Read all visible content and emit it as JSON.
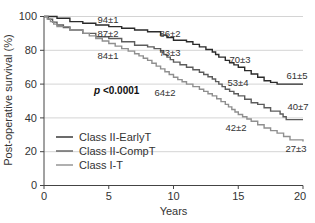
{
  "chart_data": {
    "type": "line",
    "subtype": "kaplan-meier step",
    "title": "",
    "xlabel": "Years",
    "ylabel": "Post-operative survival (%)",
    "xlim": [
      0,
      20
    ],
    "ylim": [
      0,
      100
    ],
    "xticks": [
      0,
      5,
      10,
      15,
      20
    ],
    "yticks": [
      0,
      20,
      40,
      60,
      80,
      100
    ],
    "grid": "horizontal",
    "legend_position": "lower-left",
    "annotation_text": "p <0.0001",
    "series": [
      {
        "name": "Class II-EarlyT",
        "color": "#2b2b2b",
        "x": [
          0,
          1,
          2,
          3,
          4,
          5,
          6,
          7,
          8,
          9,
          10,
          11,
          12,
          13,
          13.5,
          14,
          15,
          15.5,
          16,
          16.5,
          17,
          17.5,
          18,
          19,
          20
        ],
        "y": [
          100,
          99,
          97,
          96,
          95,
          94,
          93,
          92,
          91,
          89,
          86,
          85,
          82,
          79,
          76,
          74,
          70,
          68,
          66,
          64,
          62,
          61,
          60,
          60,
          60
        ],
        "labels": [
          {
            "x": 5,
            "text": "94±1"
          },
          {
            "x": 10,
            "text": "86±2"
          },
          {
            "x": 15,
            "text": "70±3"
          },
          {
            "x": 20,
            "text": "61±5"
          }
        ]
      },
      {
        "name": "Class II-CompT",
        "color": "#5c5c5c",
        "x": [
          0,
          1,
          2,
          3,
          4,
          5,
          6,
          7,
          8,
          8.5,
          9,
          10,
          11,
          12,
          13,
          13.5,
          14,
          15,
          15.5,
          16,
          16.5,
          17,
          17.5,
          18,
          18.7,
          19,
          20
        ],
        "y": [
          100,
          95,
          92,
          90,
          88,
          87,
          85,
          83,
          82,
          81,
          79,
          73,
          70,
          67,
          63,
          60,
          57,
          53,
          51,
          49,
          48,
          46,
          44,
          44,
          39,
          39,
          39
        ],
        "labels": [
          {
            "x": 5,
            "text": "87±2"
          },
          {
            "x": 10,
            "text": "73±3"
          },
          {
            "x": 15,
            "text": "53±4"
          },
          {
            "x": 20,
            "text": "40±7"
          }
        ]
      },
      {
        "name": "Class I-T",
        "color": "#8f8f8f",
        "x": [
          0,
          1,
          2,
          3,
          4,
          5,
          6,
          7,
          8,
          9,
          10,
          11,
          12,
          13,
          14,
          15,
          16,
          16.5,
          17,
          18,
          18.5,
          19,
          20
        ],
        "y": [
          100,
          94,
          92,
          90,
          87,
          84,
          81,
          78,
          74,
          69,
          64,
          60,
          57,
          53,
          48,
          42,
          38,
          36,
          34,
          31,
          29,
          27,
          26
        ],
        "labels": [
          {
            "x": 5,
            "text": "84±1"
          },
          {
            "x": 10,
            "text": "64±2"
          },
          {
            "x": 15,
            "text": "42±2"
          },
          {
            "x": 20,
            "text": "27±3"
          }
        ]
      }
    ]
  },
  "legend": {
    "items": [
      {
        "label": "Class II-EarlyT",
        "color": "#2b2b2b"
      },
      {
        "label": "Class II-CompT",
        "color": "#5c5c5c"
      },
      {
        "label": "Class I-T",
        "color": "#8f8f8f"
      }
    ]
  },
  "axes": {
    "x_title": "Years",
    "y_title": "Post-operative survival (%)",
    "x_tick_labels": [
      "0",
      "5",
      "10",
      "15",
      "20"
    ],
    "y_tick_labels": [
      "0",
      "20",
      "40",
      "60",
      "80",
      "100"
    ]
  },
  "annotations": {
    "p_value": "p <0.0001",
    "earlyT": [
      "94±1",
      "86±2",
      "70±3",
      "61±5"
    ],
    "compT": [
      "87±2",
      "73±3",
      "53±4",
      "40±7"
    ],
    "classI": [
      "84±1",
      "64±2",
      "42±2",
      "27±3"
    ]
  }
}
